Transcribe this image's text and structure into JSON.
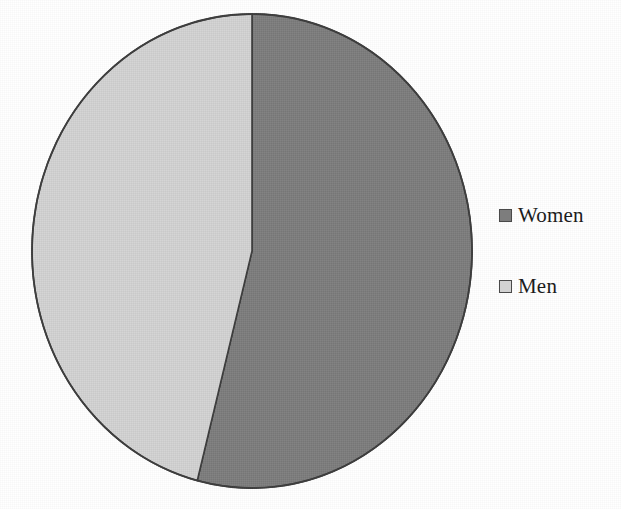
{
  "chart_data": {
    "type": "pie",
    "title": "",
    "subtitle": "",
    "xlabel": "",
    "ylabel": "",
    "grid": false,
    "legend_position": "right",
    "categories": [
      "Women",
      "Men"
    ],
    "values": [
      54,
      46
    ],
    "slices": [
      {
        "label": "Women",
        "value": 54,
        "color": "#7d7d7d",
        "start_angle_deg": 0,
        "end_angle_deg": 194.4
      },
      {
        "label": "Men",
        "value": 46,
        "color": "#d2d2d2",
        "start_angle_deg": 194.4,
        "end_angle_deg": 360
      }
    ],
    "annotations": []
  },
  "legend": {
    "entries": [
      {
        "label": "Women",
        "swatch_color": "#7d7d7d"
      },
      {
        "label": "Men",
        "swatch_color": "#d2d2d2"
      }
    ]
  },
  "figure": {
    "background": "#ffffff",
    "outline_color": "#3c3c3c",
    "center_x": 252,
    "center_y": 251,
    "radius_x": 220,
    "radius_y": 237
  }
}
